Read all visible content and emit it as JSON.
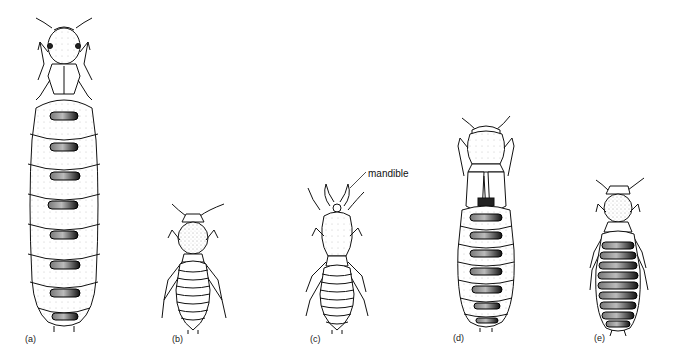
{
  "figure": {
    "callout": {
      "text": "mandible",
      "target_panel": "c"
    },
    "panels": [
      {
        "id": "a",
        "label": "(a)",
        "caste": "queen (physogastric reproductive)",
        "abdomen_segments": 8,
        "dark_plates": true
      },
      {
        "id": "b",
        "label": "(b)",
        "caste": "worker",
        "abdomen_segments": 8,
        "dark_plates": false
      },
      {
        "id": "c",
        "label": "(c)",
        "caste": "soldier",
        "abdomen_segments": 8,
        "dark_plates": false
      },
      {
        "id": "d",
        "label": "(d)",
        "caste": "reproductive with wing pads",
        "abdomen_segments": 7,
        "dark_plates": true
      },
      {
        "id": "e",
        "label": "(e)",
        "caste": "secondary reproductive",
        "abdomen_segments": 9,
        "dark_plates": true
      }
    ]
  }
}
